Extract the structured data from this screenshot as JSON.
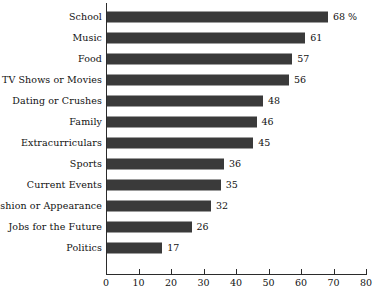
{
  "chart_data": {
    "type": "bar",
    "orientation": "horizontal",
    "title": "",
    "subtitle": "",
    "xlabel": "",
    "ylabel": "",
    "xlim": [
      0,
      80
    ],
    "xticks": [
      0,
      10,
      20,
      30,
      40,
      50,
      60,
      70,
      80
    ],
    "xtick_labels": [
      "0",
      "10",
      "20",
      "30",
      "40",
      "50",
      "60",
      "70",
      "80"
    ],
    "grid": false,
    "legend": null,
    "bar_color": "#3a3a3a",
    "axis_color": "#2b2b2b",
    "background": "#ffffff",
    "value_unit": "%",
    "categories": [
      "School",
      "Music",
      "Food",
      "TV Shows or Movies",
      "Dating or Crushes",
      "Family",
      "Extracurriculars",
      "Sports",
      "Current Events",
      "Fashion or Appearance",
      "Jobs for the Future",
      "Politics"
    ],
    "values": [
      68,
      61,
      57,
      56,
      48,
      46,
      45,
      36,
      35,
      32,
      26,
      17
    ],
    "value_labels": [
      "68 %",
      "61",
      "57",
      "56",
      "48",
      "46",
      "45",
      "36",
      "35",
      "32",
      "26",
      "17"
    ],
    "bars": [
      {
        "category": "School",
        "value": 68,
        "label": "68 %"
      },
      {
        "category": "Music",
        "value": 61,
        "label": "61"
      },
      {
        "category": "Food",
        "value": 57,
        "label": "57"
      },
      {
        "category": "TV Shows or Movies",
        "value": 56,
        "label": "56"
      },
      {
        "category": "Dating or Crushes",
        "value": 48,
        "label": "48"
      },
      {
        "category": "Family",
        "value": 46,
        "label": "46"
      },
      {
        "category": "Extracurriculars",
        "value": 45,
        "label": "45"
      },
      {
        "category": "Sports",
        "value": 36,
        "label": "36"
      },
      {
        "category": "Current Events",
        "value": 35,
        "label": "35"
      },
      {
        "category": "Fashion or Appearance",
        "value": 32,
        "label": "32"
      },
      {
        "category": "Jobs for the Future",
        "value": 26,
        "label": "26"
      },
      {
        "category": "Politics",
        "value": 17,
        "label": "17"
      }
    ]
  }
}
